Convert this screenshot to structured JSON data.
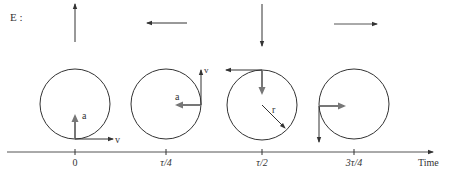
{
  "figure": {
    "label": "E :",
    "axis_label": "Time",
    "colors": {
      "line": "#333333",
      "accel_arrow": "#777777",
      "background": "#ffffff"
    },
    "moments": [
      {
        "tick": "0",
        "velocity_label": "v",
        "accel_label": "a",
        "top_arrow": "up"
      },
      {
        "tick": "τ/4",
        "velocity_label": "v",
        "accel_label": "a",
        "top_arrow": "left"
      },
      {
        "tick": "τ/2",
        "radius_label": "r",
        "top_arrow": "down"
      },
      {
        "tick": "3τ/4",
        "top_arrow": "right"
      }
    ]
  }
}
